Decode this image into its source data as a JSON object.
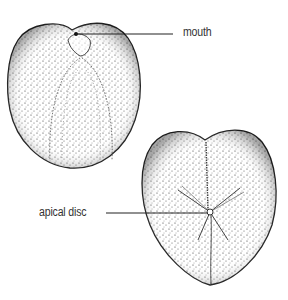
{
  "labels": {
    "mouth": "mouth",
    "apical_disc": "apical disc"
  },
  "figures": [
    {
      "name": "oral-view",
      "description": "Underside view of heart urchin test showing mouth"
    },
    {
      "name": "aboral-view",
      "description": "Upper side view of heart urchin test showing apical disc and petals"
    }
  ],
  "colors": {
    "ink": "#222222",
    "label": "#333333",
    "background": "#ffffff"
  }
}
